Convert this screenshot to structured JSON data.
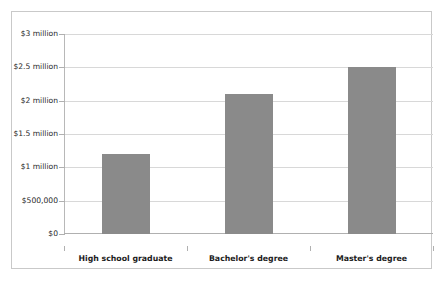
{
  "chart_data": {
    "type": "bar",
    "title": "",
    "subtitle": "",
    "xlabel": "",
    "ylabel": "",
    "categories": [
      "High school graduate",
      "Bachelor's degree",
      "Master's degree"
    ],
    "values": [
      1200000,
      2100000,
      2500000
    ],
    "value_labels": [
      "$1.2 million",
      "$2.1 million",
      "$2.5 million"
    ],
    "ylim": [
      0,
      3000000
    ],
    "yticks": [
      0,
      500000,
      1000000,
      1500000,
      2000000,
      2500000,
      3000000
    ],
    "ytick_labels": [
      "$0",
      "$500,000",
      "$1 million",
      "$1.5 million",
      "$2 million",
      "$2.5 million",
      "$3 million"
    ],
    "grid": true,
    "grid_axis": "y",
    "legend": false,
    "legend_position": "none",
    "bar_color": "#8a8a8a",
    "grid_color": "#d8d8d8",
    "axis_color": "#b0b0b0",
    "frame_color": "#c9c9c9",
    "background_color": "#ffffff"
  }
}
